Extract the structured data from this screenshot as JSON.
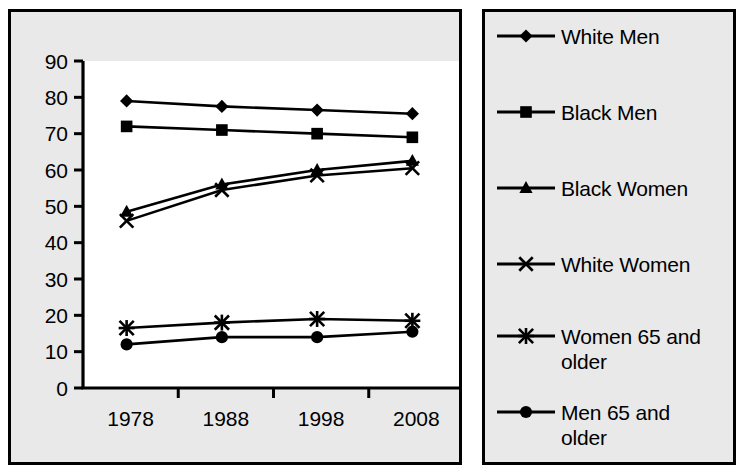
{
  "chart_data": {
    "type": "line",
    "title": "",
    "subtitle": "",
    "xlabel": "",
    "ylabel": "",
    "categories": [
      "1978",
      "1988",
      "1998",
      "2008"
    ],
    "x_tick_labels": [
      "1978",
      "1988",
      "1998",
      "2008"
    ],
    "y_tick_labels": [
      "0",
      "10",
      "20",
      "30",
      "40",
      "50",
      "60",
      "70",
      "80",
      "90"
    ],
    "y_ticks": [
      0,
      10,
      20,
      30,
      40,
      50,
      60,
      70,
      80,
      90
    ],
    "ylim": [
      0,
      90
    ],
    "grid": false,
    "legend_position": "right",
    "series": [
      {
        "name": "White Men",
        "marker": "diamond",
        "values": [
          79.0,
          77.5,
          76.5,
          75.5
        ]
      },
      {
        "name": "Black Men",
        "marker": "square",
        "values": [
          72.0,
          71.0,
          70.0,
          69.0
        ]
      },
      {
        "name": "Black Women",
        "marker": "triangle",
        "values": [
          48.5,
          56.0,
          60.0,
          62.5
        ]
      },
      {
        "name": "White Women",
        "marker": "x",
        "values": [
          46.0,
          54.5,
          58.5,
          60.5
        ]
      },
      {
        "name": "Women 65 and older",
        "marker": "asterisk",
        "values": [
          16.5,
          18.0,
          19.0,
          18.5
        ]
      },
      {
        "name": "Men 65 and older",
        "marker": "circle",
        "values": [
          12.0,
          14.0,
          14.0,
          15.5
        ]
      }
    ],
    "line_color": "#000000",
    "plot_background": "#ffffff",
    "panel_background": "#e9e9e9"
  },
  "legend": {
    "items": [
      {
        "label": "White Men",
        "marker": "diamond"
      },
      {
        "label": "Black Men",
        "marker": "square"
      },
      {
        "label": "Black Women",
        "marker": "triangle"
      },
      {
        "label": "White Women",
        "marker": "x"
      },
      {
        "label": "Women 65 and\nolder",
        "marker": "asterisk"
      },
      {
        "label": "Men 65 and\nolder",
        "marker": "circle"
      }
    ]
  }
}
